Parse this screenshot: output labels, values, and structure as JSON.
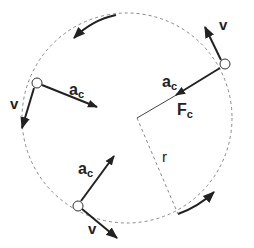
{
  "diagram": {
    "colors": {
      "stroke": "#222222",
      "dashed": "#888888",
      "background": "#ffffff"
    },
    "labels": {
      "velocity": "v",
      "accel_main": "a",
      "accel_sub": "c",
      "force_main": "F",
      "force_sub": "c",
      "radius": "r"
    },
    "particles": [
      {
        "name": "top-right",
        "v_label": "v",
        "a_label": "a",
        "a_sub": "c"
      },
      {
        "name": "left",
        "v_label": "v",
        "a_label": "a",
        "a_sub": "c"
      },
      {
        "name": "bottom",
        "v_label": "v",
        "a_label": "a",
        "a_sub": "c"
      }
    ]
  }
}
